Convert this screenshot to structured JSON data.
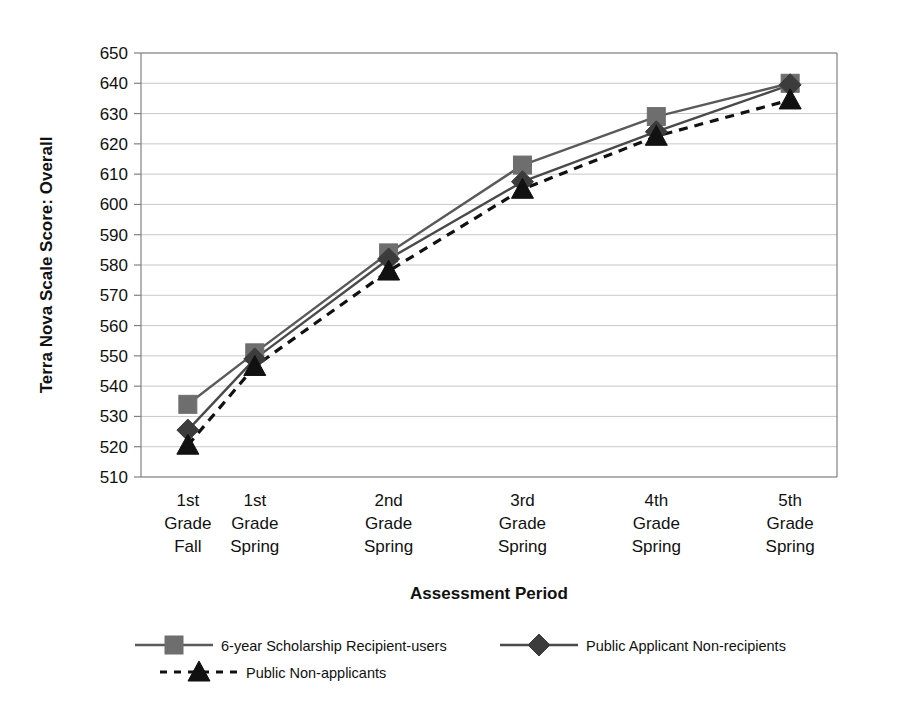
{
  "chart_data": {
    "type": "line",
    "title": "",
    "xlabel": "Assessment Period",
    "ylabel": "Terra Nova Scale Score: Overall",
    "categories": [
      "1st\nGrade\nFall",
      "1st\nGrade\nSpring",
      "2nd\nGrade\nSpring",
      "3rd\nGrade\nSpring",
      "4th\nGrade\nSpring",
      "5th\nGrade\nSpring"
    ],
    "category_lines": [
      [
        "1st",
        "Grade",
        "Fall"
      ],
      [
        "1st",
        "Grade",
        "Spring"
      ],
      [
        "2nd",
        "Grade",
        "Spring"
      ],
      [
        "3rd",
        "Grade",
        "Spring"
      ],
      [
        "4th",
        "Grade",
        "Spring"
      ],
      [
        "5th",
        "Grade",
        "Spring"
      ]
    ],
    "x_positions": [
      0,
      0.5,
      1.5,
      2.5,
      3.5,
      4.5
    ],
    "xlim": [
      -0.35,
      4.85
    ],
    "ylim": [
      510,
      650
    ],
    "yticks": [
      510,
      520,
      530,
      540,
      550,
      560,
      570,
      580,
      590,
      600,
      610,
      620,
      630,
      640,
      650
    ],
    "ytick_step": 10,
    "grid": "horizontal",
    "legend_position": "bottom",
    "series": [
      {
        "name": "6-year Scholarship Recipient-users",
        "marker": "square",
        "line_style": "solid",
        "color": "#5a5a5a",
        "marker_color": "#6e6e6e",
        "values": [
          534,
          551,
          584,
          613,
          629,
          640
        ]
      },
      {
        "name": "Public Applicant Non-recipients",
        "marker": "diamond",
        "line_style": "solid",
        "color": "#4a4a4a",
        "marker_color": "#3c3c3c",
        "values": [
          525.5,
          549,
          582,
          607.5,
          624,
          639.5
        ]
      },
      {
        "name": "Public Non-applicants",
        "marker": "triangle",
        "line_style": "dashed",
        "color": "#111111",
        "marker_color": "#111111",
        "values": [
          520.5,
          546.5,
          578,
          605,
          622.5,
          634.5
        ]
      }
    ]
  },
  "colors": {
    "background": "#ffffff",
    "gridline": "#c8c8c8",
    "axis": "#808080",
    "text": "#111111"
  }
}
